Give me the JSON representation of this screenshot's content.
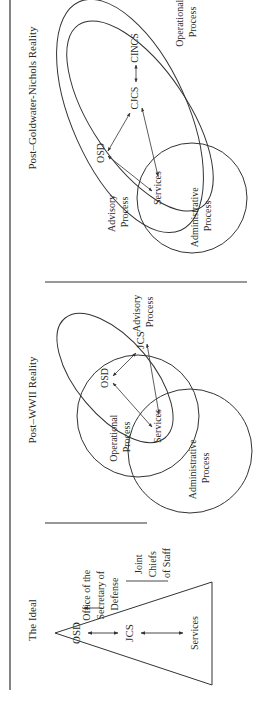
{
  "panels": {
    "ideal": {
      "title": "The Ideal",
      "nodes": {
        "osd": "OSD",
        "jcs": "JCS",
        "services": "Services"
      },
      "callouts": {
        "osd": [
          "Office of the",
          "Secretary of",
          "Defense"
        ],
        "jcs": [
          "Joint",
          "Chiefs",
          "of Staff"
        ]
      }
    },
    "post_wwii": {
      "title": "Post–WWII Reality",
      "nodes": {
        "osd": "OSD",
        "jcs": "JCS",
        "services": "Services"
      },
      "processes": {
        "advisory": [
          "Advisory",
          "Process"
        ],
        "operational": [
          "Operational",
          "Process"
        ],
        "administrative": [
          "Administrative",
          "Process"
        ]
      }
    },
    "post_gn": {
      "title": "Post–Goldwater-Nichols Reality",
      "nodes": {
        "osd": "OSD",
        "cjcs": "CJCS",
        "cincs": "CINCS",
        "services": "Services"
      },
      "processes": {
        "advisory": [
          "Advisory",
          "Process"
        ],
        "operational": [
          "Operational",
          "Process"
        ],
        "administrative": [
          "Administrative",
          "Process"
        ]
      }
    }
  },
  "colors": {
    "line": "#3a3a3a",
    "background": "#ffffff"
  }
}
